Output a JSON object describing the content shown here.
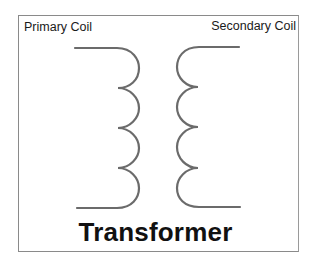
{
  "diagram": {
    "title": "Transformer",
    "labels": {
      "primary": "Primary Coil",
      "secondary": "Secondary Coil"
    },
    "coils": {
      "primary": {
        "loops": 4,
        "side": "left",
        "bulge_direction": "right"
      },
      "secondary": {
        "loops": 4,
        "side": "right",
        "bulge_direction": "left"
      }
    },
    "colors": {
      "coil_stroke": "#6b6b6b",
      "frame": "#8a8a8a",
      "text": "#111111",
      "background": "#ffffff"
    }
  }
}
